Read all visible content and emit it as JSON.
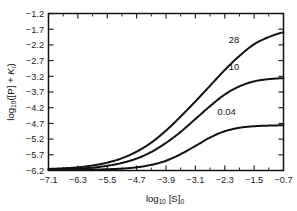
{
  "chart_data": {
    "type": "line",
    "title": "",
    "xlabel": "log10 [S]0",
    "ylabel": "log10 ([P] + KI)",
    "xlabel_main": "log",
    "xlabel_sub1": "10",
    "xlabel_mid": " [S]",
    "xlabel_sub2": "0",
    "ylabel_main": "log",
    "ylabel_sub1": "10",
    "ylabel_rest": "([P] + K",
    "ylabel_sub2": "I",
    "ylabel_close": ")",
    "xlim": [
      -7.1,
      -0.7
    ],
    "ylim": [
      -6.2,
      -1.2
    ],
    "xticks": [
      -7.1,
      -6.3,
      -5.5,
      -4.7,
      -3.9,
      -3.1,
      -2.3,
      -1.5,
      -0.7
    ],
    "xtick_labels": [
      "−7.1",
      "−6.3",
      "−5.5",
      "−4.7",
      "−3.9",
      "−3.1",
      "−2.3",
      "−1.5",
      "−0.7"
    ],
    "yticks": [
      -1.2,
      -1.7,
      -2.2,
      -2.7,
      -3.2,
      -3.7,
      -4.2,
      -4.7,
      -5.2,
      -5.7,
      -6.2
    ],
    "ytick_labels": [
      "−1.2",
      "−1.7",
      "−2.2",
      "−2.7",
      "−3.2",
      "−3.7",
      "−4.2",
      "−4.7",
      "−5.2",
      "−5.7",
      "−6.2"
    ],
    "x_minor_interval": 0.4,
    "grid": false,
    "legend_position": "inline-curve-labels",
    "line_color": "#111111",
    "background_color": "#ffffff",
    "series": [
      {
        "name": "28",
        "label": "28",
        "label_x": -2.05,
        "label_y": -2.05,
        "baseline": -6.15,
        "plateau": -1.75,
        "midpoint": -3.75,
        "slope": 1.0,
        "x": [
          -7.1,
          -6.7,
          -6.3,
          -5.9,
          -5.5,
          -5.1,
          -4.7,
          -4.3,
          -3.9,
          -3.5,
          -3.1,
          -2.7,
          -2.3,
          -1.9,
          -1.5,
          -1.1,
          -0.7
        ],
        "y": [
          -6.15,
          -6.13,
          -6.1,
          -6.04,
          -5.95,
          -5.81,
          -5.6,
          -5.31,
          -4.93,
          -4.48,
          -4.0,
          -3.5,
          -3.0,
          -2.55,
          -2.18,
          -1.95,
          -1.8
        ]
      },
      {
        "name": "10",
        "label": "10",
        "label_x": -2.05,
        "label_y": -2.9,
        "baseline": -6.15,
        "plateau": -3.25,
        "midpoint": -3.55,
        "slope": 1.0,
        "x": [
          -7.1,
          -6.7,
          -6.3,
          -5.9,
          -5.5,
          -5.1,
          -4.7,
          -4.3,
          -3.9,
          -3.5,
          -3.1,
          -2.7,
          -2.3,
          -1.9,
          -1.5,
          -1.1,
          -0.7
        ],
        "y": [
          -6.17,
          -6.16,
          -6.14,
          -6.11,
          -6.05,
          -5.96,
          -5.82,
          -5.61,
          -5.32,
          -4.97,
          -4.56,
          -4.15,
          -3.78,
          -3.52,
          -3.36,
          -3.29,
          -3.26
        ]
      },
      {
        "name": "0.04",
        "label": "0.04",
        "label_x": -2.25,
        "label_y": -4.33,
        "baseline": -6.15,
        "plateau": -4.75,
        "midpoint": -3.1,
        "slope": 1.0,
        "x": [
          -7.1,
          -6.7,
          -6.3,
          -5.9,
          -5.5,
          -5.1,
          -4.7,
          -4.3,
          -3.9,
          -3.5,
          -3.1,
          -2.7,
          -2.3,
          -1.9,
          -1.5,
          -1.1,
          -0.7
        ],
        "y": [
          -6.18,
          -6.18,
          -6.18,
          -6.17,
          -6.16,
          -6.14,
          -6.1,
          -6.02,
          -5.89,
          -5.68,
          -5.42,
          -5.15,
          -4.95,
          -4.84,
          -4.79,
          -4.77,
          -4.76
        ]
      }
    ]
  }
}
